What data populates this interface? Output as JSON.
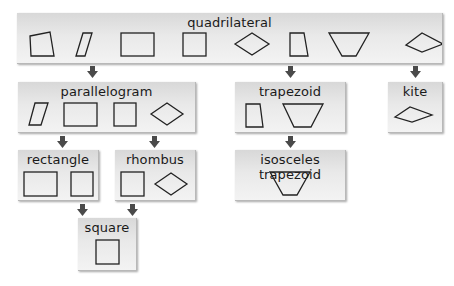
{
  "diagram": {
    "colors": {
      "box_top": "#d8d8d8",
      "box_bottom": "#f3f3f3",
      "arrow": "#4a4a4a",
      "stroke": "#222222"
    },
    "nodes": {
      "quadrilateral": {
        "label": "quadrilateral",
        "shapes": [
          "general-quadrilateral",
          "parallelogram",
          "rectangle",
          "square",
          "rhombus",
          "trapezoid",
          "isosceles-trapezoid",
          "kite"
        ]
      },
      "parallelogram": {
        "label": "parallelogram",
        "shapes": [
          "parallelogram",
          "rectangle",
          "square",
          "rhombus"
        ]
      },
      "trapezoid": {
        "label": "trapezoid",
        "shapes": [
          "right-trapezoid",
          "isosceles-trapezoid"
        ]
      },
      "kite": {
        "label": "kite",
        "shapes": [
          "kite"
        ]
      },
      "rectangle": {
        "label": "rectangle",
        "shapes": [
          "rectangle",
          "square"
        ]
      },
      "rhombus": {
        "label": "rhombus",
        "shapes": [
          "square",
          "rhombus"
        ]
      },
      "isosceles_trapezoid": {
        "label": "isosceles trapezoid",
        "shapes": [
          "isosceles-trapezoid"
        ]
      },
      "square": {
        "label": "square",
        "shapes": [
          "square"
        ]
      }
    },
    "edges": [
      [
        "quadrilateral",
        "parallelogram"
      ],
      [
        "quadrilateral",
        "trapezoid"
      ],
      [
        "quadrilateral",
        "kite"
      ],
      [
        "parallelogram",
        "rectangle"
      ],
      [
        "parallelogram",
        "rhombus"
      ],
      [
        "trapezoid",
        "isosceles_trapezoid"
      ],
      [
        "rectangle",
        "square"
      ],
      [
        "rhombus",
        "square"
      ]
    ]
  }
}
